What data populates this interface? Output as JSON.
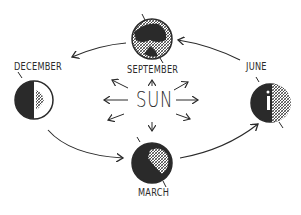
{
  "diagram": {
    "center": {
      "label": "SUN"
    },
    "earths": [
      {
        "id": "september",
        "label": "SEPTEMBER",
        "position": "top"
      },
      {
        "id": "june",
        "label": "JUNE",
        "position": "right"
      },
      {
        "id": "march",
        "label": "MARCH",
        "position": "bottom"
      },
      {
        "id": "december",
        "label": "DECEMBER",
        "position": "left"
      }
    ],
    "orbit_arrows": [
      {
        "from": "june",
        "to": "september"
      },
      {
        "from": "september",
        "to": "december"
      },
      {
        "from": "december",
        "to": "march"
      },
      {
        "from": "march",
        "to": "june"
      }
    ],
    "sun_rays": 8,
    "colors": {
      "ink": "#2a2a2a",
      "background": "#ffffff"
    }
  }
}
